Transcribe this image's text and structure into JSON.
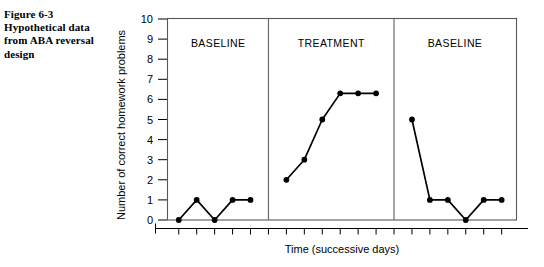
{
  "caption": {
    "lines": [
      "Figure 6-3",
      "Hypothetical data",
      "from ABA reversal",
      "design"
    ]
  },
  "chart_data": {
    "type": "line",
    "title": "",
    "xlabel": "Time (successive days)",
    "ylabel": "Number of correct homework problems",
    "ylim": [
      0,
      10
    ],
    "yticks": [
      0,
      1,
      2,
      3,
      4,
      5,
      6,
      7,
      8,
      9,
      10
    ],
    "ytick_labels": [
      "0",
      "1",
      "2",
      "3",
      "4",
      "5",
      "6",
      "7",
      "8",
      "9",
      "10"
    ],
    "xticks_labeled": false,
    "x_tick_count": 19,
    "grid": false,
    "legend": false,
    "x": [
      1,
      2,
      3,
      4,
      5,
      7,
      8,
      9,
      10,
      11,
      12,
      14,
      15,
      16,
      17,
      18,
      19
    ],
    "values": [
      0,
      1,
      0,
      1,
      1,
      2,
      3,
      5,
      6.3,
      6.3,
      6.3,
      5,
      1,
      1,
      0,
      1,
      1
    ],
    "phases": [
      {
        "name": "baseline-1",
        "label": "BASELINE",
        "x": [
          1,
          2,
          3,
          4,
          5
        ],
        "values": [
          0,
          1,
          0,
          1,
          1
        ]
      },
      {
        "name": "treatment",
        "label": "TREATMENT",
        "x": [
          7,
          8,
          9,
          10,
          11,
          12
        ],
        "values": [
          2,
          3,
          5,
          6.3,
          6.3,
          6.3
        ]
      },
      {
        "name": "baseline-2",
        "label": "BASELINE",
        "x": [
          14,
          15,
          16,
          17,
          18,
          19
        ],
        "values": [
          5,
          1,
          1,
          0,
          1,
          1
        ]
      }
    ],
    "phase_dividers_x": [
      6,
      13
    ],
    "colors": {
      "line": "#000000",
      "marker": "#000000",
      "frame": "#58585a",
      "divider": "#6b6b6d"
    }
  }
}
